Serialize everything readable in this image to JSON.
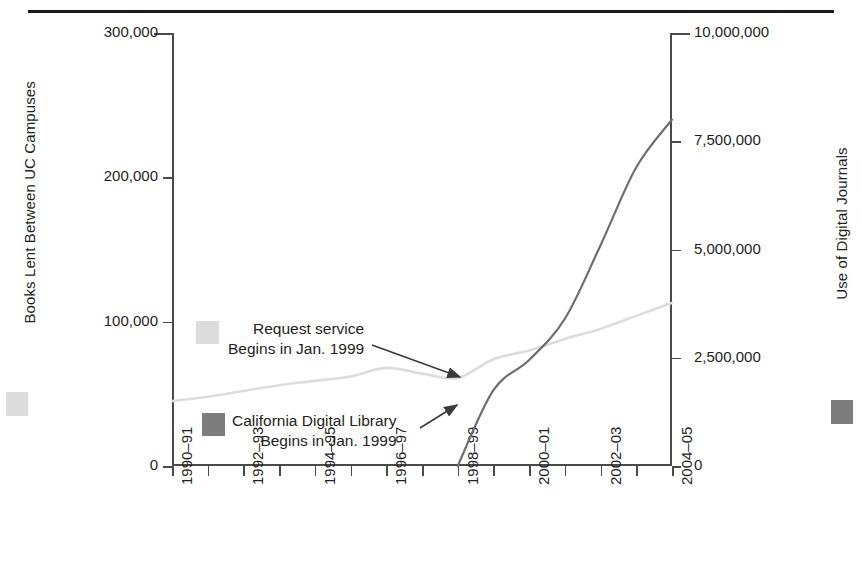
{
  "chart_data": {
    "type": "line",
    "title": "",
    "xlabel": "",
    "grid": false,
    "legend_position": "inline-annotations",
    "categories": [
      "1990-91",
      "1991-92",
      "1992-93",
      "1993-94",
      "1994-95",
      "1995-96",
      "1996-97",
      "1997-98",
      "1998-99",
      "1999-00",
      "2000-01",
      "2001-02",
      "2002-03",
      "2003-04",
      "2004-05"
    ],
    "x_tick_labels": [
      "1990–91",
      "1992–93",
      "1994–95",
      "1996–97",
      "1998–99",
      "2000–01",
      "2002–03",
      "2004–05"
    ],
    "x_tick_label_indices": [
      0,
      2,
      4,
      6,
      8,
      10,
      12,
      14
    ],
    "left_axis": {
      "label": "Books Lent Between UC Campuses",
      "ylim": [
        0,
        300000
      ],
      "ticks": [
        0,
        100000,
        200000,
        300000
      ],
      "tick_labels": [
        "0",
        "100,000",
        "200,000",
        "300,000"
      ],
      "color": "#dcdcdc"
    },
    "right_axis": {
      "label": "Use of Digital Journals",
      "ylim": [
        0,
        10000000
      ],
      "ticks": [
        0,
        2500000,
        5000000,
        7500000,
        10000000
      ],
      "tick_labels": [
        "0",
        "2,500,000",
        "5,000,000",
        "7,500,000",
        "10,000,000"
      ],
      "color": "#7d7d7d"
    },
    "series": [
      {
        "name": "Books Lent Between UC Campuses",
        "axis": "left",
        "color": "#dcdcdc",
        "values": [
          45000,
          48000,
          52000,
          56000,
          59000,
          62000,
          68000,
          64000,
          61000,
          74000,
          80000,
          88000,
          95000,
          104000,
          113000
        ]
      },
      {
        "name": "Use of Digital Journals",
        "axis": "right",
        "color": "#6e6e6e",
        "values": [
          null,
          null,
          null,
          null,
          null,
          null,
          null,
          null,
          0,
          1750000,
          2450000,
          3400000,
          5100000,
          6900000,
          8000000
        ]
      }
    ],
    "annotations": [
      {
        "id": "request-service",
        "lines": [
          "Request service",
          "Begins in Jan. 1999"
        ],
        "swatch_color": "#dcdcdc",
        "points_to": "1998-99 books-lent point"
      },
      {
        "id": "california-digital-library",
        "lines": [
          "California Digital Library",
          "Begins in Jan. 1999"
        ],
        "swatch_color": "#7d7d7d",
        "points_to": "1998-99 digital-journals start"
      }
    ]
  },
  "colors": {
    "axis": "#4a4a4a",
    "text": "#231f20",
    "rule": "#1a1a1a",
    "light_series": "#dcdcdc",
    "dark_series": "#6e6e6e"
  }
}
